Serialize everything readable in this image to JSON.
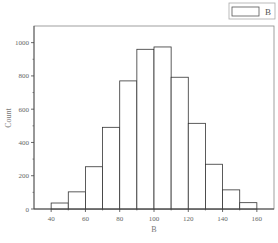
{
  "chart_data": {
    "type": "bar",
    "subtype": "histogram",
    "title": "",
    "xlabel": "B",
    "ylabel": "Count",
    "bin_edges": [
      40,
      50,
      60,
      70,
      80,
      90,
      100,
      110,
      120,
      130,
      140,
      150,
      160
    ],
    "categories": [
      "40-50",
      "50-60",
      "60-70",
      "70-80",
      "80-90",
      "90-100",
      "100-110",
      "110-120",
      "120-130",
      "130-140",
      "140-150",
      "150-160"
    ],
    "series": [
      {
        "name": "B",
        "values": [
          36,
          103,
          254,
          491,
          770,
          960,
          974,
          792,
          515,
          269,
          115,
          38
        ]
      }
    ],
    "xlim": [
      30,
      170
    ],
    "ylim": [
      0,
      1100
    ],
    "xticks": [
      40,
      60,
      80,
      100,
      120,
      140,
      160
    ],
    "yticks": [
      0,
      200,
      400,
      600,
      800,
      1000
    ],
    "grid": false,
    "legend": {
      "position": "top-right-outside",
      "entries": [
        "B"
      ]
    },
    "colors": {
      "bar_fill": "#ffffff",
      "bar_edge": "#333333",
      "axis": "#444444",
      "frame": "#888888"
    }
  }
}
